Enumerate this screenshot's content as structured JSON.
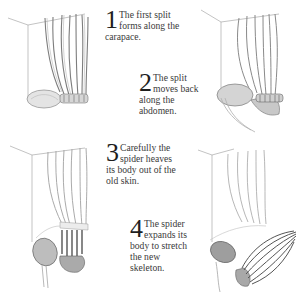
{
  "diagram": {
    "steps": [
      {
        "number": "1",
        "text": "The first split forms along the carapace."
      },
      {
        "number": "2",
        "text": "The split moves back along the abdomen."
      },
      {
        "number": "3",
        "text": "Carefully the spider heaves its body out of the old skin."
      },
      {
        "number": "4",
        "text": "The spider expands its body to stretch the new skeleton."
      }
    ],
    "colors": {
      "background": "#ffffff",
      "ink": "#3a3a3a",
      "sketch": "#8a8a8a"
    }
  }
}
